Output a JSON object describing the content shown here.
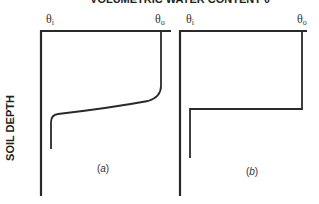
{
  "title": "VOLUMETRIC WATER CONTENT θ",
  "y_axis_label": "SOIL DEPTH",
  "panels": [
    {
      "id": "a",
      "label": "(a)",
      "left_tick": "θi",
      "right_tick": "θo",
      "profile": "gradual wetting front: θo near surface, smooth transition to θi at depth"
    },
    {
      "id": "b",
      "label": "(b)",
      "left_tick": "θi",
      "right_tick": "θo",
      "profile": "sharp (step) wetting front: θo near surface, abrupt drop to θi at depth"
    }
  ],
  "colors": {
    "line": "#2a2a2a",
    "text": "#222222",
    "background": "#ffffff"
  }
}
